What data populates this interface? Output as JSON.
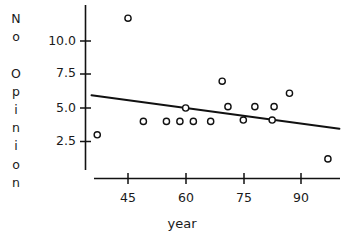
{
  "chart_data": {
    "type": "scatter",
    "title": "",
    "xlabel": "year",
    "ylabel": "No Opinion",
    "ylabel_letters": [
      "N",
      "o",
      " ",
      "O",
      "p",
      "i",
      "n",
      "i",
      "o",
      "n"
    ],
    "xticks": [
      45,
      60,
      75,
      90
    ],
    "xtick_labels": [
      "45",
      "60",
      "75",
      "90"
    ],
    "yticks": [
      2.5,
      5.0,
      7.5,
      10.0
    ],
    "ytick_labels": [
      "2.5",
      "5.0",
      "7.5",
      "10.0"
    ],
    "xlim": [
      34,
      100
    ],
    "ylim": [
      0.3,
      12.3
    ],
    "grid": false,
    "legend": false,
    "marker": "open-circle",
    "x": [
      37,
      45,
      49,
      55,
      58.5,
      60,
      62,
      66.5,
      69.5,
      71,
      75,
      78,
      82.5,
      83,
      87,
      97
    ],
    "y": [
      3.0,
      11.7,
      4.0,
      4.0,
      4.0,
      5.0,
      4.0,
      4.0,
      7.0,
      5.1,
      4.1,
      5.1,
      4.1,
      5.1,
      6.1,
      1.2
    ],
    "points": [
      {
        "x": 37,
        "y": 3.0
      },
      {
        "x": 45,
        "y": 11.7
      },
      {
        "x": 49,
        "y": 4.0
      },
      {
        "x": 55,
        "y": 4.0
      },
      {
        "x": 58.5,
        "y": 4.0
      },
      {
        "x": 60,
        "y": 5.0
      },
      {
        "x": 62,
        "y": 4.0
      },
      {
        "x": 66.5,
        "y": 4.0
      },
      {
        "x": 69.5,
        "y": 7.0
      },
      {
        "x": 71,
        "y": 5.1
      },
      {
        "x": 75,
        "y": 4.1
      },
      {
        "x": 78,
        "y": 5.1
      },
      {
        "x": 82.5,
        "y": 4.1
      },
      {
        "x": 83,
        "y": 5.1
      },
      {
        "x": 87,
        "y": 6.1
      },
      {
        "x": 97,
        "y": 1.2
      }
    ],
    "series": [
      {
        "name": "No Opinion observations",
        "type": "scatter",
        "values": [
          3.0,
          11.7,
          4.0,
          4.0,
          4.0,
          5.0,
          4.0,
          4.0,
          7.0,
          5.1,
          4.1,
          5.1,
          4.1,
          5.1,
          6.1,
          1.2
        ]
      },
      {
        "name": "fitted regression line",
        "type": "line",
        "x_endpoints": [
          35.5,
          100
        ],
        "y_endpoints": [
          5.95,
          3.45
        ]
      }
    ],
    "colors": {
      "axis": "#111111",
      "marker_stroke": "#111111",
      "marker_fill": "#ffffff",
      "trendline": "#111111",
      "background": "#ffffff"
    }
  }
}
